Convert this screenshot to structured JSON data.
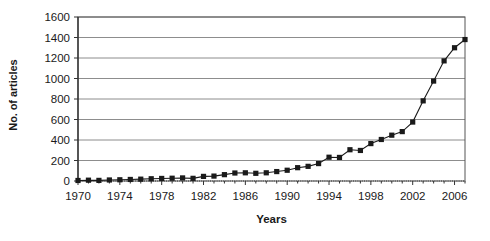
{
  "chart_data": {
    "type": "line",
    "title": "",
    "xlabel": "Years",
    "ylabel": "No. of articles",
    "xlim": [
      1970,
      2007
    ],
    "ylim": [
      0,
      1600
    ],
    "ytick_labels": [
      "1600",
      "1400",
      "1200",
      "1000",
      "800",
      "600",
      "400",
      "200",
      "0"
    ],
    "ytick_values": [
      1600,
      1400,
      1200,
      1000,
      800,
      600,
      400,
      200,
      0
    ],
    "xtick_labels": [
      "1970",
      "1974",
      "1978",
      "1982",
      "1986",
      "1990",
      "1994",
      "1998",
      "2002",
      "2006"
    ],
    "xtick_values": [
      1970,
      1974,
      1978,
      1982,
      1986,
      1990,
      1994,
      1998,
      2002,
      2006
    ],
    "grid": "horizontal",
    "legend": "none",
    "marker": "square",
    "series_color": "#1a1a1a",
    "x": [
      1970,
      1971,
      1972,
      1973,
      1974,
      1975,
      1976,
      1977,
      1978,
      1979,
      1980,
      1981,
      1982,
      1983,
      1984,
      1985,
      1986,
      1987,
      1988,
      1989,
      1990,
      1991,
      1992,
      1993,
      1994,
      1995,
      1996,
      1997,
      1998,
      1999,
      2000,
      2001,
      2002,
      2003,
      2004,
      2005,
      2006,
      2007
    ],
    "values": [
      5,
      8,
      6,
      10,
      12,
      15,
      18,
      22,
      25,
      27,
      30,
      26,
      45,
      48,
      62,
      78,
      80,
      75,
      80,
      92,
      105,
      130,
      143,
      170,
      232,
      230,
      305,
      298,
      365,
      405,
      447,
      482,
      575,
      782,
      975,
      1172,
      1300,
      1380
    ]
  }
}
